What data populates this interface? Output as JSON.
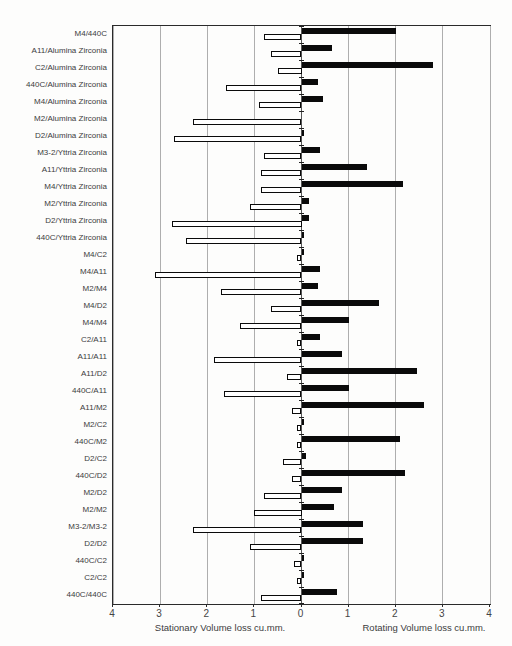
{
  "chart_data": {
    "type": "bar",
    "orientation": "horizontal-diverging",
    "title": "",
    "categories": [
      "M4/440C",
      "A11/Alumina Zirconia",
      "C2/Alumina Zirconia",
      "440C/Alumina Zirconia",
      "M4/Alumina Zirconia",
      "M2/Alumina Zirconia",
      "D2/Alumina Zirconia",
      "M3-2/Yttria Zirconia",
      "A11/Yttria Zirconia",
      "M4/Yttria Zirconia",
      "M2/Yttria Zirconia",
      "D2/Yttria Zirconia",
      "440C/Yttria Zirconia",
      "M4/C2",
      "M4/A11",
      "M2/M4",
      "M4/D2",
      "M4/M4",
      "C2/A11",
      "A11/A11",
      "A11/D2",
      "440C/A11",
      "A11/M2",
      "M2/C2",
      "440C/M2",
      "D2/C2",
      "440C/D2",
      "M2/D2",
      "M2/M2",
      "M3-2/M3-2",
      "D2/D2",
      "440C/C2",
      "C2/C2",
      "440C/440C"
    ],
    "series": [
      {
        "name": "Stationary Volume loss cu.mm.",
        "side": "left",
        "style": "white-outlined-bar",
        "values": [
          0.8,
          0.65,
          0.5,
          1.6,
          0.9,
          2.3,
          2.7,
          0.8,
          0.85,
          0.85,
          1.1,
          2.75,
          2.45,
          0.1,
          3.1,
          1.7,
          0.65,
          1.3,
          0.1,
          1.85,
          0.3,
          1.65,
          0.2,
          0.1,
          0.1,
          0.4,
          0.2,
          0.8,
          1.0,
          2.3,
          1.1,
          0.15,
          0.1,
          0.85
        ]
      },
      {
        "name": "Rotating Volume loss cu.mm.",
        "side": "right",
        "style": "solid-black-bar",
        "values": [
          2.0,
          0.65,
          2.8,
          0.35,
          0.45,
          0.0,
          0.05,
          0.4,
          1.4,
          2.15,
          0.15,
          0.15,
          0.05,
          0.05,
          0.4,
          0.35,
          1.65,
          1.0,
          0.4,
          0.85,
          2.45,
          1.0,
          2.6,
          0.05,
          2.1,
          0.1,
          2.2,
          0.85,
          0.7,
          1.3,
          1.3,
          0.05,
          0.05,
          0.75
        ]
      }
    ],
    "x_axis": {
      "tick_labels": [
        "4",
        "3",
        "2",
        "1",
        "0",
        "1",
        "2",
        "3",
        "4"
      ],
      "units_each_side": 4,
      "left_label": "Stationary Volume loss cu.mm.",
      "right_label": "Rotating Volume loss cu.mm."
    },
    "grid": true,
    "legend": false
  },
  "colors": {
    "rotating_bar": "#0a0a0a",
    "stationary_bar_fill": "#ffffff",
    "stationary_bar_border": "#0a0a0a",
    "gridline": "#aeaeae",
    "axis": "#2a2a2a",
    "text": "#3c3c3c",
    "background": "#fdfdfc"
  }
}
